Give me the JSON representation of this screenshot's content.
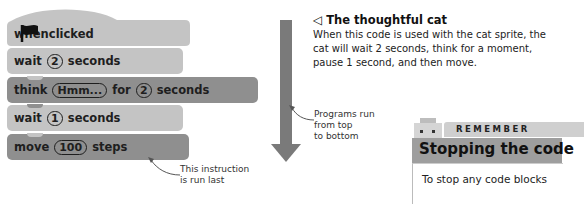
{
  "script": {
    "blocks": [
      {
        "type": "hat",
        "pre": "when",
        "icon": "green-flag-icon",
        "post": "clicked"
      },
      {
        "type": "wait",
        "word": "wait",
        "value": "2",
        "unit": "seconds"
      },
      {
        "type": "think",
        "word": "think",
        "text": "Hmm...",
        "for": "for",
        "value": "2",
        "unit": "seconds"
      },
      {
        "type": "wait",
        "word": "wait",
        "value": "1",
        "unit": "seconds"
      },
      {
        "type": "move",
        "word": "move",
        "value": "100",
        "unit": "steps"
      }
    ],
    "last_annotation": "This instruction\nis run last"
  },
  "flow": {
    "annotation_line1": "Programs run",
    "annotation_line2": "from top",
    "annotation_line3": "to bottom"
  },
  "caption": {
    "title": "The thoughtful cat",
    "body_line1": "When this code is used with the cat sprite, the",
    "body_line2": "cat will wait 2 seconds, think for a moment,",
    "body_line3": "pause 1 second, and then move."
  },
  "remember": {
    "label": "REMEMBER",
    "title": "Stopping the code",
    "body": "To stop any code blocks"
  },
  "colors": {
    "light_block": "#c4c4c4",
    "dark_block": "#8f8f8f",
    "arrow": "#7a7a7a"
  }
}
